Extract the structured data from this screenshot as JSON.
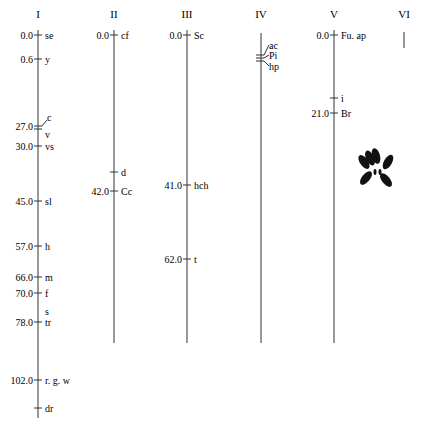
{
  "figure": {
    "type": "genetic-linkage-map",
    "units_note": "map positions",
    "chromosomes": [
      {
        "id": "I",
        "label": "I",
        "x": 38,
        "y_top": 30,
        "y_bottom": 418,
        "loci": [
          {
            "pos": "0.0",
            "gene": "se",
            "y": 35
          },
          {
            "pos": "0.6",
            "gene": "y",
            "y": 59
          },
          {
            "pos": "27.0",
            "gene": "c",
            "y": 126,
            "lead": "up",
            "double": true
          },
          {
            "pos": "",
            "gene": "v",
            "y": 134,
            "tickless": true
          },
          {
            "pos": "30.0",
            "gene": "vs",
            "y": 146
          },
          {
            "pos": "45.0",
            "gene": "sl",
            "y": 201
          },
          {
            "pos": "57.0",
            "gene": "h",
            "y": 246
          },
          {
            "pos": "66.0",
            "gene": "m",
            "y": 277
          },
          {
            "pos": "70.0",
            "gene": "f",
            "y": 293
          },
          {
            "pos": "",
            "gene": "s",
            "y": 311,
            "tickless": true
          },
          {
            "pos": "78.0",
            "gene": "tr",
            "y": 322
          },
          {
            "pos": "102.0",
            "gene": "r. g. w",
            "y": 380
          },
          {
            "pos": "",
            "gene": "dr",
            "y": 408
          }
        ]
      },
      {
        "id": "II",
        "label": "II",
        "x": 114,
        "y_top": 30,
        "y_bottom": 343,
        "loci": [
          {
            "pos": "0.0",
            "gene": "cf",
            "y": 35
          },
          {
            "pos": "",
            "gene": "d",
            "y": 172
          },
          {
            "pos": "42.0",
            "gene": "Cc",
            "y": 191
          }
        ]
      },
      {
        "id": "III",
        "label": "III",
        "x": 187,
        "y_top": 30,
        "y_bottom": 343,
        "loci": [
          {
            "pos": "0.0",
            "gene": "Sc",
            "y": 35
          },
          {
            "pos": "41.0",
            "gene": "hch",
            "y": 185
          },
          {
            "pos": "62.0",
            "gene": "t",
            "y": 259
          }
        ]
      },
      {
        "id": "IV",
        "label": "IV",
        "x": 261,
        "y_top": 33,
        "y_bottom": 343,
        "loci": [
          {
            "pos": "",
            "gene": "ac",
            "y": 48
          },
          {
            "pos": "",
            "gene": "Pi",
            "y": 58
          },
          {
            "pos": "",
            "gene": "hp",
            "y": 69
          }
        ],
        "cluster": true
      },
      {
        "id": "V",
        "label": "V",
        "x": 334,
        "y_top": 30,
        "y_bottom": 343,
        "loci": [
          {
            "pos": "0.0",
            "gene": "Fu. ap",
            "y": 35
          },
          {
            "pos": "",
            "gene": "i",
            "y": 98
          },
          {
            "pos": "21.0",
            "gene": "Br",
            "y": 113
          }
        ]
      },
      {
        "id": "VI",
        "label": "VI",
        "x": 404,
        "y_top": 32,
        "y_bottom": 48,
        "loci": []
      }
    ],
    "headers": [
      "I",
      "II",
      "III",
      "IV",
      "V",
      "VI"
    ],
    "karyotype_icon": "chromosome-spread-icon"
  }
}
